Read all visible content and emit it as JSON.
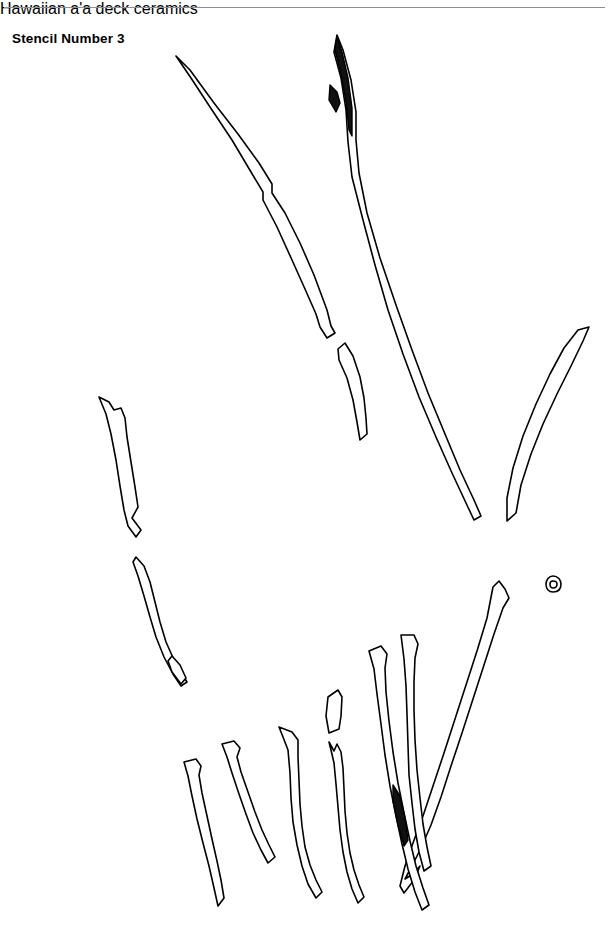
{
  "page": {
    "background_color": "#ffffff",
    "ink_color": "#000000",
    "width": 613,
    "height": 937
  },
  "header": {
    "running_head": "Hawaiian a'a deck ceramics",
    "rule_color": "#8f9096",
    "running_head_color": "#8d8d93"
  },
  "figure": {
    "title": "Stencil Number 3",
    "title_color": "#000000",
    "caption": "",
    "fragment_count": 19,
    "fragments": [
      {
        "name": "long-sliver-upper-left",
        "label": "1"
      },
      {
        "name": "long-sliver-upper-center",
        "label": "2"
      },
      {
        "name": "short-sliver-center",
        "label": "3"
      },
      {
        "name": "long-sliver-center-right",
        "label": "4"
      },
      {
        "name": "curved-sliver-right",
        "label": "5"
      },
      {
        "name": "sliver-left-upper",
        "label": "6"
      },
      {
        "name": "sliver-left-lower",
        "label": "7"
      },
      {
        "name": "tiny-ring",
        "label": "8"
      },
      {
        "name": "long-sliver-right-lower",
        "label": "9"
      },
      {
        "name": "sliver-bottom-1",
        "label": "10"
      },
      {
        "name": "sliver-bottom-2",
        "label": "11"
      },
      {
        "name": "sliver-bottom-3",
        "label": "12"
      },
      {
        "name": "small-quad-bottom",
        "label": "13"
      },
      {
        "name": "needle-bottom-center",
        "label": "14"
      },
      {
        "name": "sliver-bottom-4",
        "label": "15"
      },
      {
        "name": "sliver-bottom-5",
        "label": "16"
      },
      {
        "name": "long-sliver-bottom-right",
        "label": "17"
      }
    ]
  }
}
